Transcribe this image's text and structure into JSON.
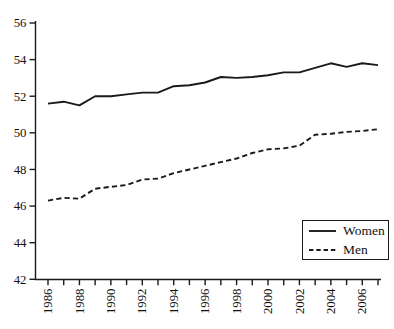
{
  "chart_data": {
    "type": "line",
    "title": "",
    "xlabel": "",
    "ylabel": "",
    "x": [
      1986,
      1987,
      1988,
      1989,
      1990,
      1991,
      1992,
      1993,
      1994,
      1995,
      1996,
      1997,
      1998,
      1999,
      2000,
      2001,
      2002,
      2003,
      2004,
      2005,
      2006,
      2007
    ],
    "series": [
      {
        "name": "Women",
        "style": "solid",
        "values": [
          51.6,
          51.7,
          51.5,
          52.0,
          52.0,
          52.1,
          52.2,
          52.2,
          52.55,
          52.6,
          52.75,
          53.05,
          53.0,
          53.05,
          53.15,
          53.3,
          53.3,
          53.55,
          53.8,
          53.6,
          53.8,
          53.7
        ]
      },
      {
        "name": "Men",
        "style": "dashed",
        "values": [
          46.3,
          46.45,
          46.4,
          46.95,
          47.05,
          47.15,
          47.45,
          47.5,
          47.8,
          48.0,
          48.2,
          48.4,
          48.6,
          48.9,
          49.1,
          49.15,
          49.3,
          49.9,
          49.95,
          50.05,
          50.1,
          50.2
        ]
      }
    ],
    "xlim": [
      1986,
      2007
    ],
    "ylim": [
      42,
      56
    ],
    "y_ticks": [
      56,
      54,
      52,
      50,
      48,
      46,
      44,
      42
    ],
    "x_tick_labels": [
      "1986",
      "1988",
      "1990",
      "1992",
      "1994",
      "1996",
      "1998",
      "2000",
      "2002",
      "2004",
      "2006"
    ],
    "x_tick_every_year": true,
    "x_label_rotation_deg": -90,
    "grid": false,
    "legend": {
      "position": "bottom-right",
      "entries": [
        "Women",
        "Men"
      ]
    },
    "colors": {
      "line": "#1a1a1a",
      "background": "#ffffff"
    }
  }
}
